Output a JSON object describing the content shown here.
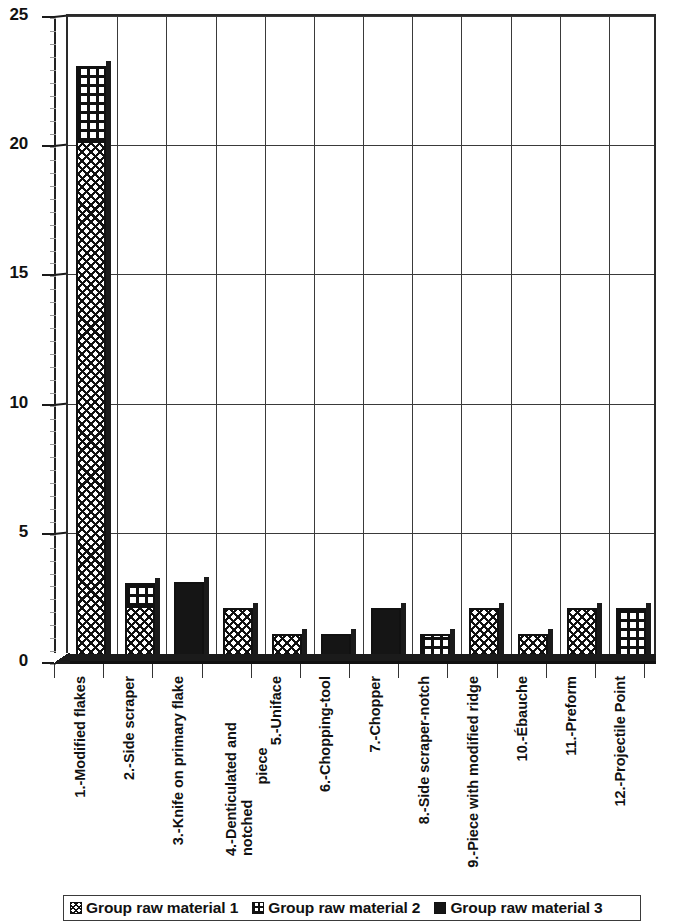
{
  "chart_data": {
    "type": "bar",
    "subtype": "stacked-bar-3d",
    "title": "",
    "xlabel": "",
    "ylabel": "",
    "ylim": [
      0,
      25
    ],
    "yticks": [
      0,
      5,
      10,
      15,
      20,
      25
    ],
    "grid": "both",
    "legend_position": "bottom",
    "categories": [
      "1.-Modified flakes",
      "2.-Side scraper",
      "3.-Knife on primary flake",
      "4.-Denticulated and notched piece",
      "5.-Uniface",
      "6.-Chopping-tool",
      "7.-Chopper",
      "8.-Side scraper-notch",
      "9.-Piece with modified ridge",
      "10.-Ébauche",
      "11.-Preform",
      "12.-Projectile Point"
    ],
    "category_lines": [
      [
        "1.-Modified flakes"
      ],
      [
        "2.-Side scraper"
      ],
      [
        "3.-Knife on primary flake"
      ],
      [
        "4.-Denticulated and notched",
        "piece"
      ],
      [
        "5.-Uniface"
      ],
      [
        "6.-Chopping-tool"
      ],
      [
        "7.-Chopper"
      ],
      [
        "8.-Side scraper-notch"
      ],
      [
        "9.-Piece with modified ridge"
      ],
      [
        "10.-Ébauche"
      ],
      [
        "11.-Preform"
      ],
      [
        "12.-Projectile Point"
      ]
    ],
    "series": [
      {
        "name": "Group raw material 1",
        "pattern": "crosshatch",
        "values": [
          20,
          2,
          0,
          2,
          1,
          0,
          0,
          0,
          2,
          1,
          2,
          0
        ]
      },
      {
        "name": "Group raw material 2",
        "pattern": "grid",
        "values": [
          3,
          1,
          0,
          0,
          0,
          0,
          0,
          1,
          0,
          0,
          0,
          2
        ]
      },
      {
        "name": "Group raw material 3",
        "pattern": "solid",
        "values": [
          0,
          0,
          3,
          0,
          0,
          1,
          2,
          0,
          0,
          0,
          0,
          0
        ]
      }
    ],
    "totals": [
      23,
      3,
      3,
      2,
      1,
      1,
      2,
      1,
      2,
      1,
      2,
      2
    ]
  },
  "legend": {
    "items": [
      {
        "label": "Group raw material 1",
        "pattern": "crosshatch"
      },
      {
        "label": "Group raw material 2",
        "pattern": "grid"
      },
      {
        "label": "Group raw material 3",
        "pattern": "solid"
      }
    ]
  },
  "colors": {
    "ink": "#111111",
    "grid": "#3a3a3a",
    "background": "#ffffff"
  }
}
